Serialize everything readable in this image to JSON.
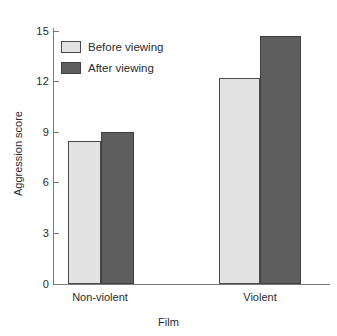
{
  "chart_data": {
    "type": "bar",
    "title": "",
    "xlabel": "Film",
    "ylabel": "Aggression score",
    "categories": [
      "Non-violent",
      "Violent"
    ],
    "series": [
      {
        "name": "Before viewing",
        "values": [
          8.5,
          12.2
        ],
        "color": "#e2e2e2"
      },
      {
        "name": "After viewing",
        "values": [
          9.0,
          14.7
        ],
        "color": "#5e5e5e"
      }
    ],
    "ylim": [
      0,
      15
    ],
    "yticks": [
      0,
      3,
      6,
      9,
      12,
      15
    ],
    "ytick_labels": [
      "0",
      "3",
      "6",
      "9",
      "12",
      "15"
    ],
    "grid": false,
    "legend_position": "top-left",
    "axis_color": "#7a7a7a",
    "bar_border_color": "#4a4a4a",
    "background": "#ffffff"
  },
  "legend": {
    "items": [
      {
        "label": "Before viewing",
        "swatch": "light"
      },
      {
        "label": "After viewing",
        "swatch": "dark"
      }
    ]
  },
  "axes": {
    "y_title": "Aggression score",
    "x_title": "Film",
    "y_tick_labels": [
      "15",
      "12",
      "9",
      "6",
      "3",
      "0"
    ],
    "x_tick_labels": [
      "Non-violent",
      "Violent"
    ]
  }
}
